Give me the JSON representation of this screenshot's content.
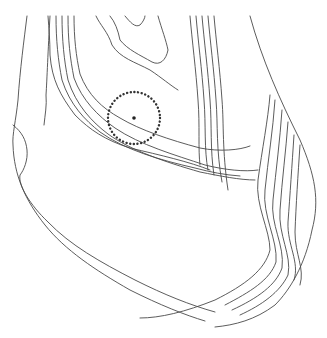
{
  "map": {
    "width": 327,
    "height": 338,
    "background": "#ffffff",
    "line_color": "#4a4a4a",
    "marker": {
      "cx": 134,
      "cy": 118,
      "r": 26,
      "dot_r": 1.8,
      "color": "#333333"
    },
    "contours": [
      "M27,16 C24,40 20,70 18,100 C16,120 12,135 13,145 C14,175 25,200 45,225 C65,250 95,270 130,290 C160,305 185,315 205,321",
      "M13,125 C22,132 26,140 27,150 C28,160 24,170 20,175 C18,185 30,205 48,222 C70,245 100,262 135,280 C165,295 190,305 215,312",
      "M50,16 C48,50 47,80 46,95 C47,105 45,115 44,125",
      "M48,16 C49,30 50,40 50,55 C52,80 60,95 75,115 C90,130 105,140 130,148 C160,155 190,162 210,170",
      "M56,16 C56,40 58,60 62,80 C70,105 85,120 100,132 C125,150 160,160 195,168 C210,172 225,175 240,176",
      "M62,16 C62,40 64,60 68,80 C76,105 92,122 108,134 C130,150 165,162 200,172 C220,176 240,180 255,180",
      "M68,16 C68,40 70,58 74,78 C82,100 98,116 115,128 C140,145 175,155 205,165 C225,170 245,172 258,170",
      "M74,16 C74,38 76,56 80,74 C88,95 102,108 120,118 C140,130 170,140 200,148 C220,152 240,150 250,146",
      "M96,16 C100,25 108,32 112,45 C120,58 135,62 150,70 C162,78 170,85 178,90",
      "M110,16 C115,22 118,30 120,40 C128,50 140,55 152,62 C160,66 166,60 168,50 C166,40 162,30 158,16",
      "M125,16 C130,22 135,28 140,25 C143,22 145,18 145,16",
      "M190,16 C192,40 196,70 198,100 C200,125 198,150 200,165",
      "M196,16 C198,40 202,70 204,100 C206,125 204,150 208,170",
      "M202,16 C204,40 208,70 210,100 C212,125 210,150 214,175",
      "M208,16 C210,40 214,70 216,100 C218,125 216,150 222,182",
      "M214,16 C216,40 220,70 222,100 C224,125 222,150 228,190",
      "M250,16 C262,60 280,100 300,140 C315,175 320,200 312,230 C305,265 290,290 275,305 C255,320 235,325 215,327",
      "M270,95 C268,120 262,150 258,180 C255,205 270,230 270,250 C265,270 245,285 215,300 C185,312 160,318 140,318",
      "M275,100 C273,130 268,160 265,190 C262,215 278,240 276,262 C270,280 250,292 225,305",
      "M282,110 C280,140 276,170 273,200 C270,225 285,245 282,268 C276,285 258,298 232,310",
      "M288,122 C286,150 282,180 280,210 C278,235 292,255 288,275 C280,292 262,305 240,315",
      "M294,135 C292,165 290,195 288,222 C287,245 300,262 294,280",
      "M300,145 C298,175 296,205 295,232 C295,255 305,268 300,285"
    ]
  }
}
